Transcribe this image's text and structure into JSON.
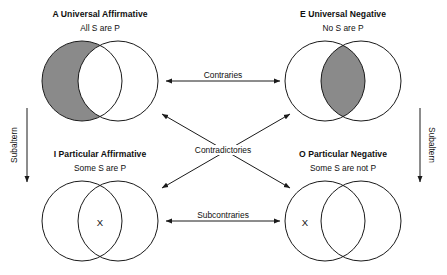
{
  "diagram": {
    "title_internal": "square-of-opposition",
    "colors": {
      "stroke": "#1a1a1a",
      "shade": "#8a8a8a",
      "background": "#ffffff",
      "text": "#101010"
    }
  },
  "quadrants": [
    {
      "key": "A",
      "title": "A Universal Affirmative",
      "subtitle": "All S are P",
      "shading": "left-circle-only",
      "x_mark": null
    },
    {
      "key": "E",
      "title": "E Universal Negative",
      "subtitle": "No S are P",
      "shading": "intersection-lens",
      "x_mark": null
    },
    {
      "key": "I",
      "title": "I Particular Affirmative",
      "subtitle": "Some S are P",
      "shading": "none",
      "x_mark": "X",
      "x_position": "intersection"
    },
    {
      "key": "O",
      "title": "O Particular Negative",
      "subtitle": "Some S are not P",
      "shading": "none",
      "x_mark": "X",
      "x_position": "left-circle-only"
    }
  ],
  "relations": [
    {
      "key": "contraries",
      "label": "Contraries",
      "kind": "horizontal-double-arrow"
    },
    {
      "key": "contradictories",
      "label": "Contradictories",
      "kind": "diagonal-double-arrows"
    },
    {
      "key": "subcontraries",
      "label": "Subcontraries",
      "kind": "horizontal-double-arrow"
    },
    {
      "key": "subaltern_left",
      "label": "Subaltern",
      "kind": "vertical-down-arrow"
    },
    {
      "key": "subaltern_right",
      "label": "Subaltern",
      "kind": "vertical-down-arrow"
    }
  ]
}
